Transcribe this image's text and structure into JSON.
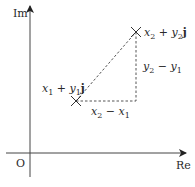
{
  "diagram": {
    "title": "",
    "axes": {
      "x_label": "Re",
      "y_label": "Im",
      "origin_label": "O"
    },
    "points": [
      {
        "id": "z1",
        "marker": "cross",
        "label_x": "x",
        "label_x_sub": "1",
        "label_plus": " + ",
        "label_y": "y",
        "label_y_sub": "1",
        "label_j": "j"
      },
      {
        "id": "z2",
        "marker": "cross",
        "label_x": "x",
        "label_x_sub": "2",
        "label_plus": " + ",
        "label_y": "y",
        "label_y_sub": "2",
        "label_j": "j"
      }
    ],
    "differences": {
      "horizontal": {
        "a": "x",
        "a_sub": "2",
        "minus": " − ",
        "b": "x",
        "b_sub": "1"
      },
      "vertical": {
        "a": "y",
        "a_sub": "2",
        "minus": " − ",
        "b": "y",
        "b_sub": "1"
      }
    },
    "colors": {
      "axis": "#333333",
      "dashed": "#555555",
      "text": "#2a2a2a"
    }
  }
}
